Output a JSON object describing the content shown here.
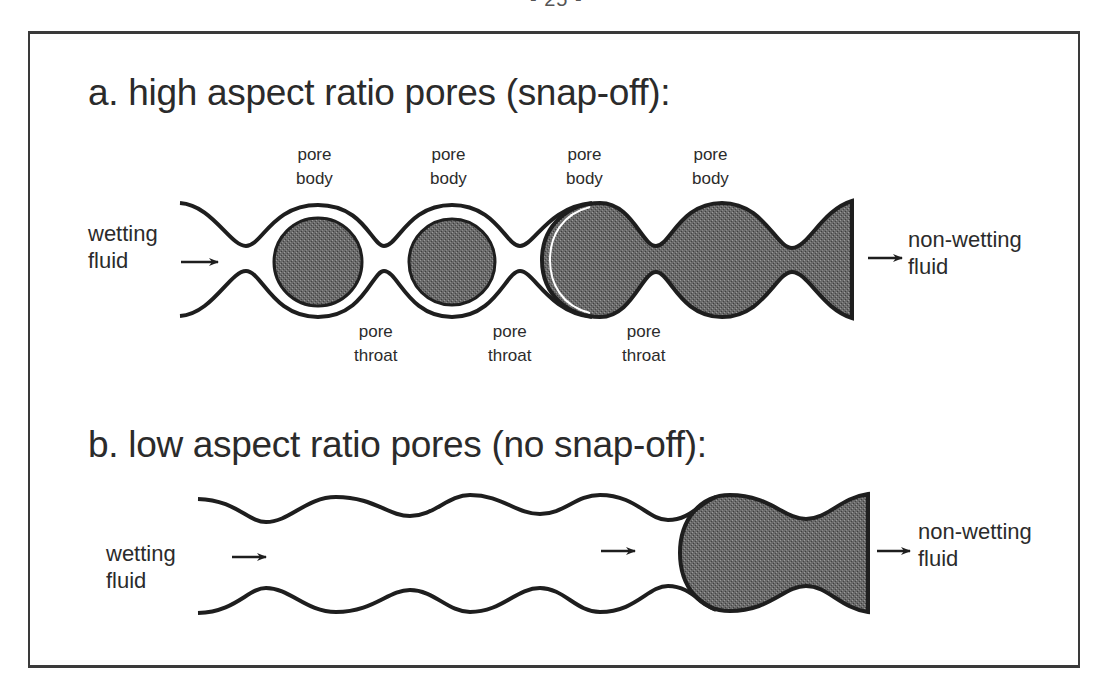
{
  "page": {
    "page_number": "- 25 -"
  },
  "section_a": {
    "title": "a. high aspect ratio pores (snap-off):",
    "inlet": {
      "line1": "wetting",
      "line2": "fluid"
    },
    "outlet": {
      "line1": "non-wetting",
      "line2": "fluid"
    },
    "pore_body_labels": [
      {
        "line1": "pore",
        "line2": "body"
      },
      {
        "line1": "pore",
        "line2": "body"
      },
      {
        "line1": "pore",
        "line2": "body"
      },
      {
        "line1": "pore",
        "line2": "body"
      }
    ],
    "pore_throat_labels": [
      {
        "line1": "pore",
        "line2": "throat"
      },
      {
        "line1": "pore",
        "line2": "throat"
      },
      {
        "line1": "pore",
        "line2": "throat"
      }
    ]
  },
  "section_b": {
    "title": "b. low aspect ratio pores (no snap-off):",
    "inlet": {
      "line1": "wetting",
      "line2": "fluid"
    },
    "outlet": {
      "line1": "non-wetting",
      "line2": "fluid"
    }
  },
  "colors": {
    "wall_stroke": "#1e1e1e",
    "non_wetting_fill": "#5e5e5e",
    "frame_border": "#3a3a3a",
    "background": "#ffffff"
  }
}
